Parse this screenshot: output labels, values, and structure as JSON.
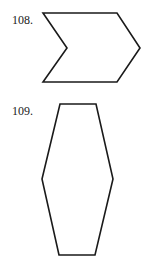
{
  "problems": [
    {
      "number": "108.",
      "shape": "chevron",
      "points": "43,13 117,13 140,48 117,82 43,82 67,48"
    },
    {
      "number": "109.",
      "shape": "hexagon",
      "points": "60,104 96,104 113,179 95,255 59,255 42,179"
    }
  ],
  "colors": {
    "stroke": "#1a1a1a",
    "fill": "#ffffff"
  }
}
